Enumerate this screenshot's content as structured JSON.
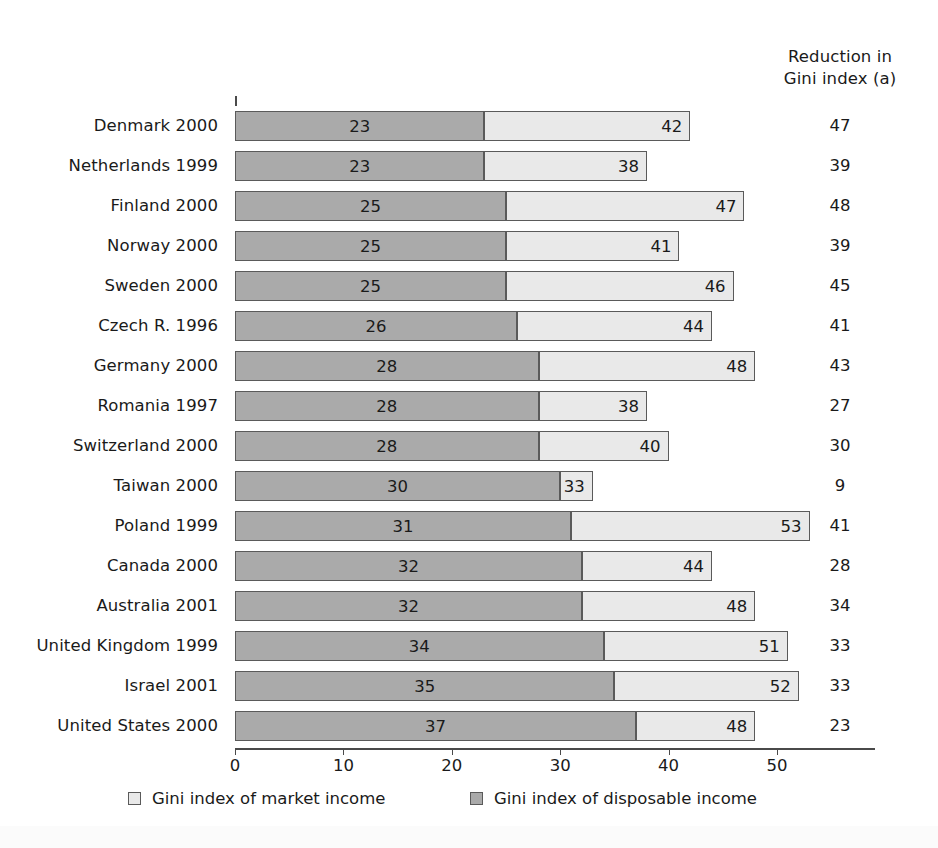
{
  "chart_data": {
    "type": "bar",
    "subtype": "stacked-horizontal",
    "title": "",
    "xlabel": "",
    "ylabel": "",
    "xlim": [
      0,
      59
    ],
    "xticks": [
      0,
      10,
      20,
      30,
      40,
      50
    ],
    "xtick_labels": [
      "0",
      "10",
      "20",
      "30",
      "40",
      "50"
    ],
    "grid": false,
    "legend_position": "bottom",
    "categories": [
      "Denmark 2000",
      "Netherlands 1999",
      "Finland 2000",
      "Norway 2000",
      "Sweden 2000",
      "Czech R. 1996",
      "Germany 2000",
      "Romania 1997",
      "Switzerland 2000",
      "Taiwan 2000",
      "Poland 1999",
      "Canada 2000",
      "Australia 2001",
      "United Kingdom 1999",
      "Israel 2001",
      "United States 2000"
    ],
    "series": [
      {
        "name": "Gini index of disposable income",
        "color": "#aaaaaa",
        "values": [
          23,
          23,
          25,
          25,
          25,
          26,
          28,
          28,
          28,
          30,
          31,
          32,
          32,
          34,
          35,
          37
        ]
      },
      {
        "name": "Gini index of market income",
        "color": "#e9e9e9",
        "values": [
          42,
          38,
          47,
          41,
          46,
          44,
          48,
          38,
          40,
          33,
          53,
          44,
          48,
          51,
          52,
          48
        ]
      }
    ],
    "annotation_column": {
      "header_lines": [
        "Reduction in",
        "Gini index (a)"
      ],
      "values": [
        47,
        39,
        48,
        39,
        45,
        41,
        43,
        27,
        30,
        9,
        41,
        28,
        34,
        33,
        33,
        23
      ]
    }
  },
  "rows": [
    {
      "label": "Denmark 2000",
      "disposable": 23,
      "market": 42,
      "reduction": 47
    },
    {
      "label": "Netherlands 1999",
      "disposable": 23,
      "market": 38,
      "reduction": 39
    },
    {
      "label": "Finland 2000",
      "disposable": 25,
      "market": 47,
      "reduction": 48
    },
    {
      "label": "Norway 2000",
      "disposable": 25,
      "market": 41,
      "reduction": 39
    },
    {
      "label": "Sweden 2000",
      "disposable": 25,
      "market": 46,
      "reduction": 45
    },
    {
      "label": "Czech R. 1996",
      "disposable": 26,
      "market": 44,
      "reduction": 41
    },
    {
      "label": "Germany 2000",
      "disposable": 28,
      "market": 48,
      "reduction": 43
    },
    {
      "label": "Romania 1997",
      "disposable": 28,
      "market": 38,
      "reduction": 27
    },
    {
      "label": "Switzerland 2000",
      "disposable": 28,
      "market": 40,
      "reduction": 30
    },
    {
      "label": "Taiwan 2000",
      "disposable": 30,
      "market": 33,
      "reduction": 9
    },
    {
      "label": "Poland 1999",
      "disposable": 31,
      "market": 53,
      "reduction": 41
    },
    {
      "label": "Canada 2000",
      "disposable": 32,
      "market": 44,
      "reduction": 28
    },
    {
      "label": "Australia 2001",
      "disposable": 32,
      "market": 48,
      "reduction": 34
    },
    {
      "label": "United Kingdom 1999",
      "disposable": 34,
      "market": 51,
      "reduction": 33
    },
    {
      "label": "Israel 2001",
      "disposable": 35,
      "market": 52,
      "reduction": 33
    },
    {
      "label": "United States 2000",
      "disposable": 37,
      "market": 48,
      "reduction": 23
    }
  ],
  "reduction_column": {
    "header_line_1": "Reduction in",
    "header_line_2": "Gini index (a)"
  },
  "axis": {
    "ticks": [
      "0",
      "10",
      "20",
      "30",
      "40",
      "50"
    ]
  },
  "legend": {
    "market_label": "Gini index of market income",
    "disposable_label": "Gini index of disposable income"
  },
  "colors": {
    "disposable_fill": "#aaaaaa",
    "market_fill": "#e9e9e9",
    "outline": "#5a5a5a",
    "axis": "#4a4a4a",
    "text": "#1a1a1a",
    "background": "#ffffff"
  }
}
